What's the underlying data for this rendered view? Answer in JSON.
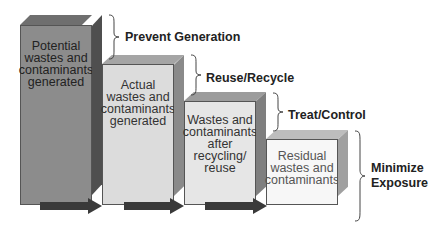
{
  "diagram": {
    "stages": [
      {
        "label": "Potential wastes and contaminants generated",
        "lines": [
          "Potential",
          "wastes and",
          "contaminants",
          "generated"
        ],
        "fill": "#8c8c8c",
        "side": "#5f5f5f",
        "top": "#7a7a7a"
      },
      {
        "label": "Actual wastes and contaminants generated",
        "lines": [
          "Actual",
          "wastes and",
          "contaminants",
          "generated"
        ],
        "fill": "#dcdcdc",
        "side": "#9a9a9a",
        "top": "#b8b8b8"
      },
      {
        "label": "Wastes and contaminants after recycling/ reuse",
        "lines": [
          "Wastes and",
          "contaminants",
          "after",
          "recycling/",
          "reuse"
        ],
        "fill": "#e6e6e6",
        "side": "#8f8f8f",
        "top": "#b0b0b0"
      },
      {
        "label": "Residual wastes and contaminants",
        "lines": [
          "Residual",
          "wastes and",
          "contaminants"
        ],
        "fill": "#f7f7f7",
        "side": "#a8a8a8",
        "top": "#c4c4c4"
      }
    ],
    "steps": [
      {
        "label": "Prevent Generation"
      },
      {
        "label": "Reuse/Recycle"
      },
      {
        "label": "Treat/Control"
      },
      {
        "label": "Minimize Exposure",
        "lines": [
          "Minimize",
          "Exposure"
        ]
      }
    ],
    "arrow_color": "#3a3a3a"
  }
}
